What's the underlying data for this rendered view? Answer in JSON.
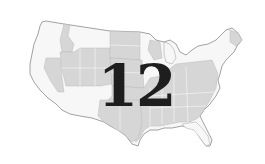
{
  "map": {
    "subject": "United States map",
    "colors": {
      "background": "#ffffff",
      "state_shaded": "#d6d6d6",
      "state_unshaded": "#f7f7f7",
      "border": "#a8a8a8",
      "outline": "#8a8a8a",
      "number": "#1e1e1e"
    },
    "overlay_number": "12",
    "shaded_regions": [
      "Idaho",
      "Nevada",
      "Utah",
      "Wyoming",
      "Colorado",
      "North Dakota",
      "South Dakota",
      "Nebraska",
      "Kansas",
      "Wisconsin",
      "Ohio",
      "Pennsylvania",
      "West Virginia",
      "Virginia",
      "Kentucky",
      "Tennessee",
      "North Carolina",
      "South Carolina",
      "Georgia",
      "Alabama",
      "Mississippi",
      "Louisiana",
      "Arkansas",
      "Oklahoma",
      "Texas",
      "New Mexico",
      "Missouri",
      "Maine"
    ],
    "unshaded_regions": [
      "Washington",
      "Oregon",
      "California",
      "Montana",
      "Arizona",
      "Minnesota",
      "Iowa",
      "Michigan",
      "Illinois",
      "Indiana",
      "Florida",
      "New York",
      "Vermont",
      "New Hampshire"
    ]
  }
}
